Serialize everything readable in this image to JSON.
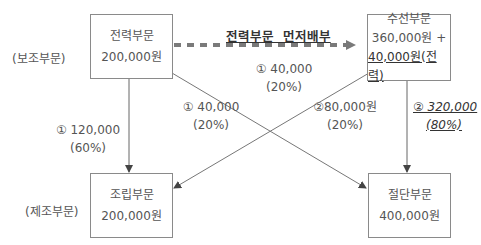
{
  "groups": {
    "support": "(보조부문)",
    "production": "(제조부문)"
  },
  "boxes": {
    "power": {
      "name": "전력부문",
      "amount": "200,000원"
    },
    "repair": {
      "name": "수선부문",
      "amount": "360,000원 +",
      "allocated": "40,000원(전력)"
    },
    "assembly": {
      "name": "조립부문",
      "amount": "200,000원"
    },
    "cutting": {
      "name": "절단부문",
      "amount": "400,000원"
    }
  },
  "priority_label": "전력부문  먼저배부",
  "flows": {
    "power_to_repair": {
      "amount": "① 40,000",
      "pct": "(20%)"
    },
    "power_to_cutting": {
      "amount": "① 40,000",
      "pct": "(20%)"
    },
    "power_to_assembly": {
      "amount": "① 120,000",
      "pct": "(60%)"
    },
    "repair_to_assembly": {
      "amount": "②80,000원",
      "pct": "(20%)"
    },
    "repair_to_cutting": {
      "amount": "② 320,000",
      "pct": "(80%)"
    }
  },
  "colors": {
    "dashed_arrow": "#7a7a7a",
    "line": "#777777",
    "box_border": "#8a8a8a",
    "text": "#555555"
  }
}
